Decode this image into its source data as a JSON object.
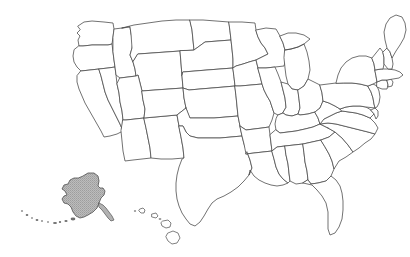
{
  "document": {
    "title": "Blank map of the United States",
    "type": "reference-map",
    "background_color": "#ffffff",
    "width": 410,
    "height": 257
  },
  "map": {
    "name": "united-states-state-outline-map",
    "projection_note": "Alaska and Hawaii shown as insets below the southwest",
    "outline_color": "#4a4a4a",
    "land_fill_color": "#ffffff",
    "highlight_fill_color": "#b2b2b2",
    "labels_visible": false,
    "legend_visible": false,
    "title_visible": false,
    "highlighted_states": [
      "Alaska"
    ],
    "states": [
      {
        "id": "WA",
        "name": "Washington",
        "highlighted": false
      },
      {
        "id": "OR",
        "name": "Oregon",
        "highlighted": false
      },
      {
        "id": "CA",
        "name": "California",
        "highlighted": false
      },
      {
        "id": "NV",
        "name": "Nevada",
        "highlighted": false
      },
      {
        "id": "ID",
        "name": "Idaho",
        "highlighted": false
      },
      {
        "id": "MT",
        "name": "Montana",
        "highlighted": false
      },
      {
        "id": "WY",
        "name": "Wyoming",
        "highlighted": false
      },
      {
        "id": "UT",
        "name": "Utah",
        "highlighted": false
      },
      {
        "id": "AZ",
        "name": "Arizona",
        "highlighted": false
      },
      {
        "id": "NM",
        "name": "New Mexico",
        "highlighted": false
      },
      {
        "id": "CO",
        "name": "Colorado",
        "highlighted": false
      },
      {
        "id": "ND",
        "name": "North Dakota",
        "highlighted": false
      },
      {
        "id": "SD",
        "name": "South Dakota",
        "highlighted": false
      },
      {
        "id": "NE",
        "name": "Nebraska",
        "highlighted": false
      },
      {
        "id": "KS",
        "name": "Kansas",
        "highlighted": false
      },
      {
        "id": "OK",
        "name": "Oklahoma",
        "highlighted": false
      },
      {
        "id": "TX",
        "name": "Texas",
        "highlighted": false
      },
      {
        "id": "MN",
        "name": "Minnesota",
        "highlighted": false
      },
      {
        "id": "IA",
        "name": "Iowa",
        "highlighted": false
      },
      {
        "id": "MO",
        "name": "Missouri",
        "highlighted": false
      },
      {
        "id": "AR",
        "name": "Arkansas",
        "highlighted": false
      },
      {
        "id": "LA",
        "name": "Louisiana",
        "highlighted": false
      },
      {
        "id": "WI",
        "name": "Wisconsin",
        "highlighted": false
      },
      {
        "id": "IL",
        "name": "Illinois",
        "highlighted": false
      },
      {
        "id": "MI",
        "name": "Michigan",
        "highlighted": false
      },
      {
        "id": "IN",
        "name": "Indiana",
        "highlighted": false
      },
      {
        "id": "OH",
        "name": "Ohio",
        "highlighted": false
      },
      {
        "id": "KY",
        "name": "Kentucky",
        "highlighted": false
      },
      {
        "id": "TN",
        "name": "Tennessee",
        "highlighted": false
      },
      {
        "id": "MS",
        "name": "Mississippi",
        "highlighted": false
      },
      {
        "id": "AL",
        "name": "Alabama",
        "highlighted": false
      },
      {
        "id": "GA",
        "name": "Georgia",
        "highlighted": false
      },
      {
        "id": "FL",
        "name": "Florida",
        "highlighted": false
      },
      {
        "id": "SC",
        "name": "South Carolina",
        "highlighted": false
      },
      {
        "id": "NC",
        "name": "North Carolina",
        "highlighted": false
      },
      {
        "id": "VA",
        "name": "Virginia",
        "highlighted": false
      },
      {
        "id": "WV",
        "name": "West Virginia",
        "highlighted": false
      },
      {
        "id": "MD",
        "name": "Maryland",
        "highlighted": false
      },
      {
        "id": "DE",
        "name": "Delaware",
        "highlighted": false
      },
      {
        "id": "PA",
        "name": "Pennsylvania",
        "highlighted": false
      },
      {
        "id": "NJ",
        "name": "New Jersey",
        "highlighted": false
      },
      {
        "id": "NY",
        "name": "New York",
        "highlighted": false
      },
      {
        "id": "CT",
        "name": "Connecticut",
        "highlighted": false
      },
      {
        "id": "RI",
        "name": "Rhode Island",
        "highlighted": false
      },
      {
        "id": "MA",
        "name": "Massachusetts",
        "highlighted": false
      },
      {
        "id": "VT",
        "name": "Vermont",
        "highlighted": false
      },
      {
        "id": "NH",
        "name": "New Hampshire",
        "highlighted": false
      },
      {
        "id": "ME",
        "name": "Maine",
        "highlighted": false
      },
      {
        "id": "AK",
        "name": "Alaska",
        "highlighted": true
      },
      {
        "id": "HI",
        "name": "Hawaii",
        "highlighted": false
      }
    ]
  }
}
